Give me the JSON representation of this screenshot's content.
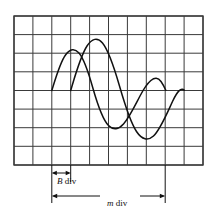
{
  "figure": {
    "name": "oscilloscope-phase-measurement-figure",
    "background": "#ffffff",
    "width": 217,
    "height": 223,
    "grid": {
      "name": "oscilloscope-graticule",
      "x": 14,
      "y": 16,
      "columns": 10,
      "rows": 8,
      "cell_width": 18.9,
      "cell_height": 18.6,
      "line_color": "#3a3a3a",
      "border_color": "#3a3a3a"
    },
    "curves": [
      {
        "name": "reference-sine-wave",
        "label": "reference waveform",
        "color": "#111111",
        "stroke_width": 1.4,
        "amplitude_divisions": 2.2,
        "period_divisions": 6.0,
        "start_division_x": 2.0,
        "baseline_division_y": 4.0
      },
      {
        "name": "lagging-sine-wave",
        "label": "phase-shifted waveform",
        "color": "#111111",
        "stroke_width": 1.4,
        "amplitude_divisions": 2.7,
        "period_divisions": 6.0,
        "start_division_x": 3.0,
        "baseline_division_y": 4.0
      }
    ],
    "annotations": {
      "b_div": {
        "name": "b-div-dimension",
        "text_italic": "B",
        "text_unit": " div",
        "full_text": "B div",
        "arrow_y": 173,
        "x_start": 52,
        "x_end": 71,
        "tick_top": 165,
        "tick_bottom": 182
      },
      "m_div": {
        "name": "m-div-dimension",
        "text_italic": "m",
        "text_unit": " div",
        "full_text": "m div",
        "arrow_y": 196,
        "x_start": 52,
        "x_end": 166,
        "tick_top": 165,
        "tick_bottom": 203
      }
    },
    "line_color": "#111111"
  }
}
